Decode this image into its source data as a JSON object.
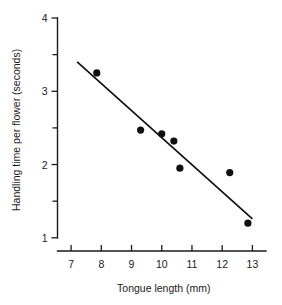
{
  "chart_data": {
    "type": "scatter",
    "title": "",
    "xlabel": "Tongue length (mm)",
    "ylabel": "Handling time per flower (seconds)",
    "xlim": [
      6.55,
      13.45
    ],
    "ylim": [
      0.82,
      4.0
    ],
    "xticks": [
      7,
      8,
      9,
      10,
      11,
      12,
      13
    ],
    "xtick_labels": [
      "7",
      "8",
      "9",
      "10",
      "11",
      "12",
      "13"
    ],
    "yticks": [
      1,
      2,
      3,
      4
    ],
    "ytick_labels": [
      "1",
      "2",
      "3",
      "4"
    ],
    "yticks_minor": [
      1.5,
      2.5,
      3.5
    ],
    "grid": false,
    "legend": "none",
    "points": [
      {
        "x": 7.85,
        "y": 3.25
      },
      {
        "x": 9.3,
        "y": 2.47
      },
      {
        "x": 10.0,
        "y": 2.42
      },
      {
        "x": 10.4,
        "y": 2.32
      },
      {
        "x": 10.6,
        "y": 1.95
      },
      {
        "x": 12.25,
        "y": 1.89
      },
      {
        "x": 12.85,
        "y": 1.2
      }
    ],
    "fit_line": {
      "label": "regression line",
      "x_start": 7.2,
      "y_start": 3.4,
      "x_end": 13.0,
      "y_end": 1.26
    }
  },
  "axes": {
    "x_axis_name": "x-axis",
    "y_axis_name": "y-axis"
  }
}
